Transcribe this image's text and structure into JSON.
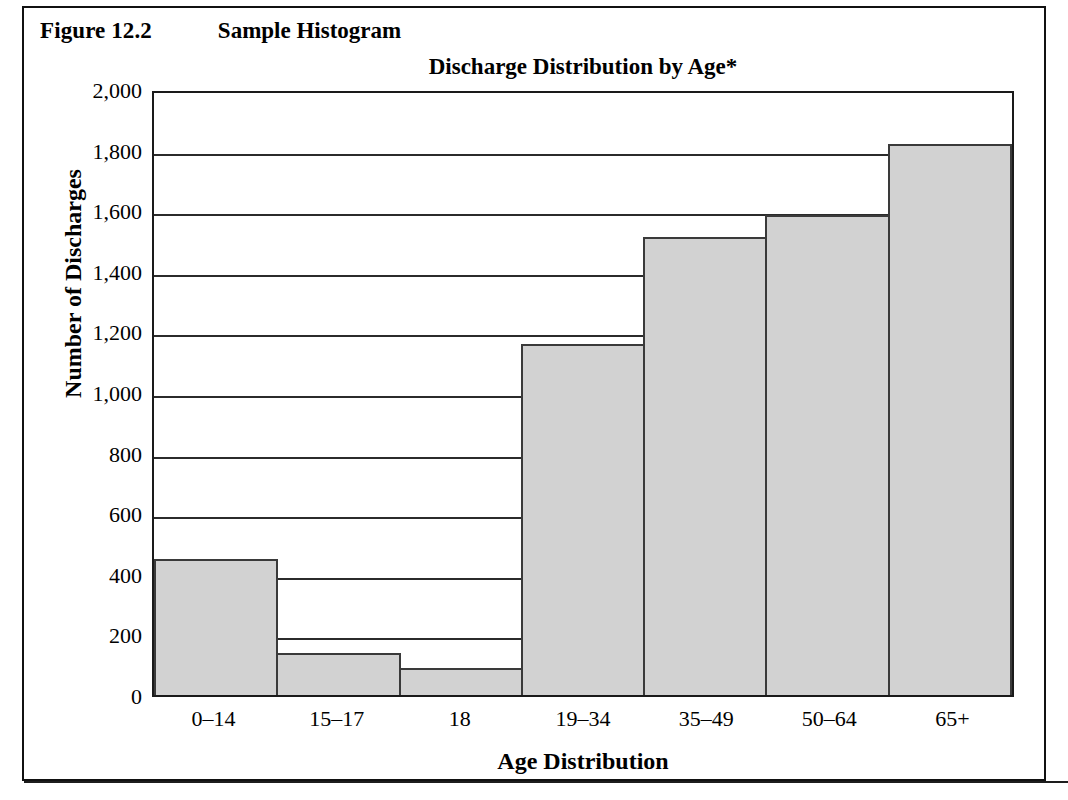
{
  "figure": {
    "number": "Figure 12.2",
    "caption": "Sample Histogram"
  },
  "footnote": {
    "text": ""
  },
  "chart_data": {
    "type": "bar",
    "title": "Discharge Distribution by Age*",
    "xlabel": "Age Distribution",
    "ylabel": "Number of Discharges",
    "categories": [
      "0–14",
      "15–17",
      "18",
      "19–34",
      "35–49",
      "50–64",
      "65+"
    ],
    "values": [
      450,
      140,
      90,
      1160,
      1510,
      1585,
      1820
    ],
    "ylim": [
      0,
      2000
    ],
    "ytick_step": 200,
    "ytick_labels": [
      "2,000",
      "1,800",
      "1,600",
      "1,400",
      "1,200",
      "1,000",
      "800",
      "600",
      "400",
      "200",
      "0"
    ],
    "ytick_values": [
      2000,
      1800,
      1600,
      1400,
      1200,
      1000,
      800,
      600,
      400,
      200,
      0
    ],
    "grid": true,
    "legend": false,
    "bar_fill": "#d2d2d2",
    "bar_edge": "#3a3a3a",
    "axis_color": "#1a1a1a"
  }
}
